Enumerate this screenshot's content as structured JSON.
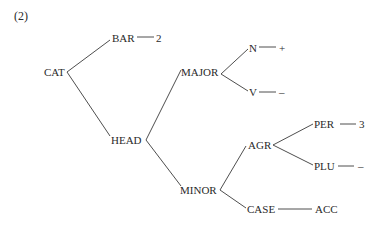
{
  "example_number": "(2)",
  "nodes": {
    "cat": "CAT",
    "bar": "BAR",
    "bar_value": "2",
    "head": "HEAD",
    "major": "MAJOR",
    "n": "N",
    "n_value": "+",
    "v": "V",
    "v_value": "–",
    "minor": "MINOR",
    "agr": "AGR",
    "per": "PER",
    "per_value": "3",
    "plu": "PLU",
    "plu_value": "–",
    "case": "CASE",
    "case_value": "ACC"
  }
}
